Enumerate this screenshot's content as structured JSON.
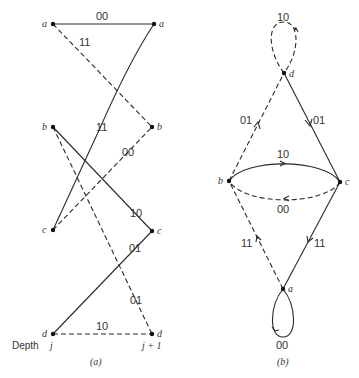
{
  "trellis": {
    "caption": "(a)",
    "depth_label": "Depth",
    "depth_j": "j",
    "depth_j1": "j + 1",
    "nodes": {
      "a": "a",
      "b": "b",
      "c": "c",
      "d": "d"
    },
    "edges": [
      {
        "from": "a",
        "to": "a",
        "label": "00",
        "style": "solid"
      },
      {
        "from": "a",
        "to": "b",
        "label": "11",
        "style": "dashed"
      },
      {
        "from": "c",
        "to": "a",
        "label": "11",
        "style": "solid"
      },
      {
        "from": "c",
        "to": "b",
        "label": "00",
        "style": "dashed"
      },
      {
        "from": "b",
        "to": "c",
        "label": "10",
        "style": "solid"
      },
      {
        "from": "d",
        "to": "c",
        "label": "01",
        "style": "solid"
      },
      {
        "from": "b",
        "to": "d",
        "label": "01",
        "style": "dashed"
      },
      {
        "from": "d",
        "to": "d",
        "label": "10",
        "style": "dashed"
      }
    ]
  },
  "state_diagram": {
    "caption": "(b)",
    "nodes": {
      "a": "a",
      "b": "b",
      "c": "c",
      "d": "d"
    },
    "edges": [
      {
        "from": "d",
        "to": "d",
        "label": "10",
        "style": "dashed"
      },
      {
        "from": "b",
        "to": "d",
        "label": "01",
        "style": "dashed"
      },
      {
        "from": "d",
        "to": "c",
        "label": "01",
        "style": "solid"
      },
      {
        "from": "b",
        "to": "c",
        "label": "10",
        "style": "solid"
      },
      {
        "from": "c",
        "to": "b",
        "label": "00",
        "style": "dashed"
      },
      {
        "from": "a",
        "to": "b",
        "label": "11",
        "style": "dashed"
      },
      {
        "from": "c",
        "to": "a",
        "label": "11",
        "style": "solid"
      },
      {
        "from": "a",
        "to": "a",
        "label": "00",
        "style": "solid"
      }
    ]
  }
}
